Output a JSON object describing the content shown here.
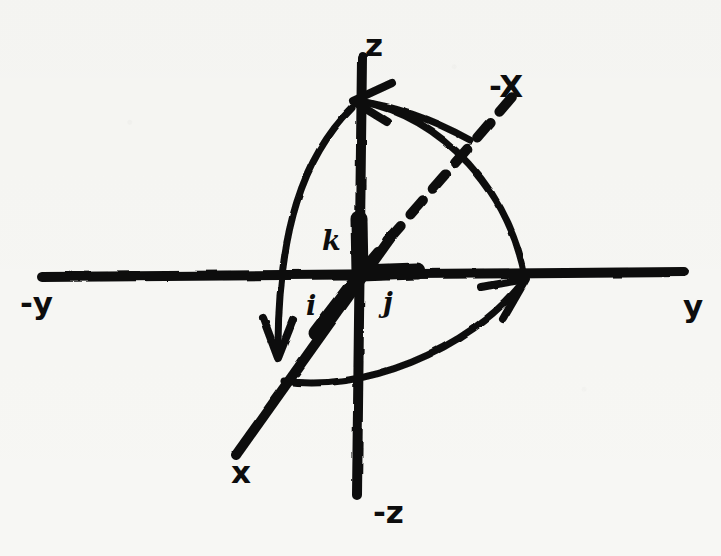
{
  "figure": {
    "background_color": "#f7f7f4",
    "ink_color": "#0d0d0d",
    "width": 721,
    "height": 556,
    "origin": {
      "x": 360,
      "y": 274
    },
    "axes": [
      {
        "name": "y-axis",
        "kind": "solid-line",
        "from": {
          "x": 42,
          "y": 277
        },
        "to": {
          "x": 684,
          "y": 272
        },
        "stroke_width": 9
      },
      {
        "name": "z-axis",
        "kind": "solid-line",
        "from": {
          "x": 362,
          "y": 58
        },
        "to": {
          "x": 357,
          "y": 495
        },
        "stroke_width": 9
      },
      {
        "name": "x-axis",
        "kind": "solid-line",
        "from": {
          "x": 236,
          "y": 455
        },
        "to": {
          "x": 392,
          "y": 236
        },
        "stroke_width": 9
      },
      {
        "name": "negative-x-axis",
        "kind": "dashed-line",
        "from": {
          "x": 366,
          "y": 264
        },
        "to": {
          "x": 512,
          "y": 97
        },
        "stroke_width": 9,
        "dash_pattern": "18 14"
      }
    ],
    "unit_vectors": [
      {
        "name": "k",
        "label": "k",
        "along": "z",
        "from": {
          "x": 360,
          "y": 272
        },
        "to": {
          "x": 359,
          "y": 218
        }
      },
      {
        "name": "j",
        "label": "j",
        "along": "y",
        "from": {
          "x": 360,
          "y": 272
        },
        "to": {
          "x": 416,
          "y": 271
        }
      },
      {
        "name": "i",
        "label": "i",
        "along": "x",
        "from": {
          "x": 360,
          "y": 274
        },
        "to": {
          "x": 318,
          "y": 330
        }
      }
    ],
    "rotation_arcs": [
      {
        "name": "arc-x-to-z",
        "description": "curved arrow sweeping from the x side up to the +z axis",
        "path": "M 283 378 C 262 300, 278 175, 357 104",
        "arrow_at": {
          "x": 357,
          "y": 104
        },
        "arrow_direction": "up-left"
      },
      {
        "name": "arc-negx-to-y",
        "description": "curved arrow sweeping from lower-left up to the +y axis",
        "path": "M 288 380 C 360 392, 470 350, 524 281",
        "arrow_at": {
          "x": 524,
          "y": 281
        },
        "arrow_direction": "up-right"
      },
      {
        "name": "arc-z-to-negy",
        "description": "curved arrow descending along the left, ending in a down arrow",
        "path": "M 352 108 C 300 160, 278 230, 278 348",
        "arrow_at": {
          "x": 278,
          "y": 356
        },
        "arrow_direction": "down"
      },
      {
        "name": "arc-negx-outer",
        "description": "outer curved sweep from the z axis out to the right on the y axis",
        "path": "M 360 101 C 444 116, 508 190, 525 276",
        "arrow_at": null,
        "arrow_direction": null
      }
    ],
    "labels": [
      {
        "name": "z-label",
        "text": "z",
        "x": 365,
        "y": 30,
        "style": "label-big"
      },
      {
        "name": "neg-z-label",
        "text": "-z",
        "x": 373,
        "y": 497,
        "style": "label-big"
      },
      {
        "name": "y-label",
        "text": "y",
        "x": 683,
        "y": 291,
        "style": "label-big"
      },
      {
        "name": "neg-y-label",
        "text": "-y",
        "x": 20,
        "y": 288,
        "style": "label-big"
      },
      {
        "name": "x-label",
        "text": "x",
        "x": 231,
        "y": 457,
        "style": "label-big"
      },
      {
        "name": "neg-x-label",
        "text": "-X",
        "x": 489,
        "y": 71,
        "style": "label-big"
      },
      {
        "name": "k-unit-label",
        "text": "k",
        "x": 322,
        "y": 227,
        "style": "label-unit"
      },
      {
        "name": "j-unit-label",
        "text": "j",
        "x": 383,
        "y": 289,
        "style": "label-unit"
      },
      {
        "name": "i-unit-label",
        "text": "i",
        "x": 306,
        "y": 292,
        "style": "label-unit"
      }
    ]
  }
}
